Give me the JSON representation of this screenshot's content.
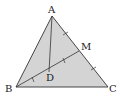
{
  "figure": {
    "type": "geometry-triangle",
    "fill_color": "#d4d4d4",
    "stroke_color": "#333333",
    "points": {
      "A": {
        "label": "A"
      },
      "B": {
        "label": "B"
      },
      "C": {
        "label": "C"
      },
      "M": {
        "label": "M"
      },
      "D": {
        "label": "D"
      }
    },
    "segments": [
      "AB",
      "BC",
      "CA",
      "BM",
      "AD"
    ],
    "relations": [
      "M is the midpoint of AC (AM = MC, marked with single ticks)",
      "D is the midpoint of BM (BD = DM, marked with single ticks)"
    ]
  }
}
